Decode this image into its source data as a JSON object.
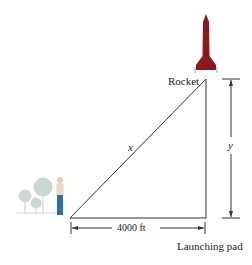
{
  "diagram": {
    "labels": {
      "rocket": "Rocket",
      "hypotenuse": "x",
      "height": "y",
      "base": "4000 ft",
      "pad": "Launching pad"
    },
    "colors": {
      "rocket": "#8b1a1f",
      "lines": "#333333",
      "trees": "#c9d8d0",
      "person_pants": "#2f6fa8",
      "person_shirt": "#e8d8c4"
    }
  }
}
